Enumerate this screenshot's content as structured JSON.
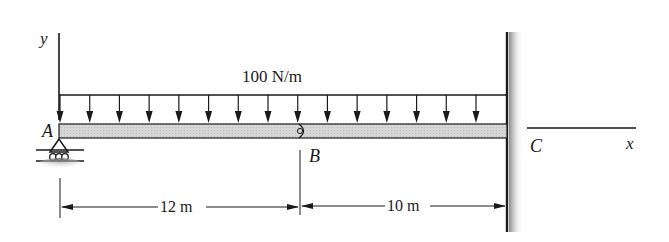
{
  "diagram": {
    "type": "beam-free-body",
    "load": {
      "label": "100 N/m",
      "kind": "uniformly distributed load",
      "intensity": 100,
      "unit": "N/m",
      "arrow_count": 15
    },
    "axes": {
      "y_label": "y",
      "x_label": "x"
    },
    "points": {
      "A": "A",
      "B": "B",
      "C": "C"
    },
    "supports": {
      "A": "roller",
      "B": "hinge",
      "C": "fixed wall"
    },
    "dimensions": [
      {
        "from": "A",
        "to": "B",
        "label": "12 m",
        "value": 12
      },
      {
        "from": "B",
        "to": "C",
        "label": "10 m",
        "value": 10
      }
    ],
    "colors": {
      "ink": "#1a1a1a",
      "beam_fill": "#d4d4d4",
      "wall_shade": "#9a9a9a"
    }
  }
}
